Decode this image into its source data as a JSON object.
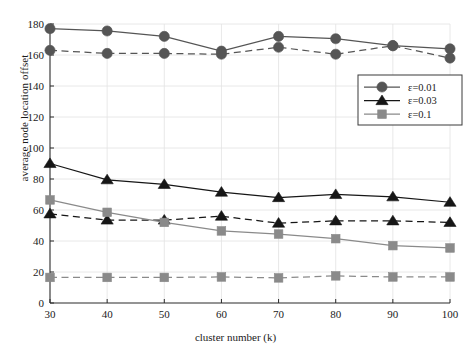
{
  "chart_data": {
    "type": "line",
    "title": "",
    "xlabel": "cluster number (k)",
    "ylabel": "average node location offset",
    "x": [
      30,
      40,
      50,
      60,
      70,
      80,
      90,
      100
    ],
    "xlim": [
      30,
      100
    ],
    "ylim": [
      0,
      180
    ],
    "xticks": [
      "30",
      "40",
      "50",
      "60",
      "70",
      "80",
      "90",
      "100"
    ],
    "yticks": [
      "0",
      "20",
      "40",
      "60",
      "80",
      "100",
      "120",
      "140",
      "160",
      "180"
    ],
    "grid": true,
    "legend_position": "upper right",
    "legend_entries": [
      "ε=0.01",
      "ε=0.03",
      "ε=0.1"
    ],
    "series": [
      {
        "name": "ε=0.01 (solid)",
        "legend": "ε=0.01",
        "marker": "circle",
        "linestyle": "solid",
        "color": "#555555",
        "values": [
          177,
          175.5,
          172,
          162.5,
          172,
          170.5,
          166,
          164
        ]
      },
      {
        "name": "ε=0.01 (dashed)",
        "legend": "ε=0.01",
        "marker": "circle",
        "linestyle": "dashed",
        "color": "#555555",
        "values": [
          163,
          161,
          161,
          160.5,
          165,
          160.5,
          166,
          158
        ]
      },
      {
        "name": "ε=0.03 (solid)",
        "legend": "ε=0.03",
        "marker": "triangle",
        "linestyle": "solid",
        "color": "#161616",
        "values": [
          90,
          79.5,
          76.5,
          71.5,
          68,
          70,
          68.5,
          65
        ]
      },
      {
        "name": "ε=0.03 (dashed)",
        "legend": "ε=0.03",
        "marker": "triangle",
        "linestyle": "dashed",
        "color": "#161616",
        "values": [
          57.5,
          53.5,
          53.5,
          56,
          51.5,
          53,
          53,
          52
        ]
      },
      {
        "name": "ε=0.1 (solid)",
        "legend": "ε=0.1",
        "marker": "square",
        "linestyle": "solid",
        "color": "#8a8a8a",
        "values": [
          66.5,
          58.5,
          52,
          46.5,
          44.5,
          41.5,
          37,
          35.5
        ]
      },
      {
        "name": "ε=0.1 (dashed)",
        "legend": "ε=0.1",
        "marker": "square",
        "linestyle": "dashed",
        "color": "#8a8a8a",
        "values": [
          16.5,
          16.5,
          16.5,
          16.8,
          16.2,
          17.5,
          16.8,
          16.8
        ]
      }
    ]
  }
}
